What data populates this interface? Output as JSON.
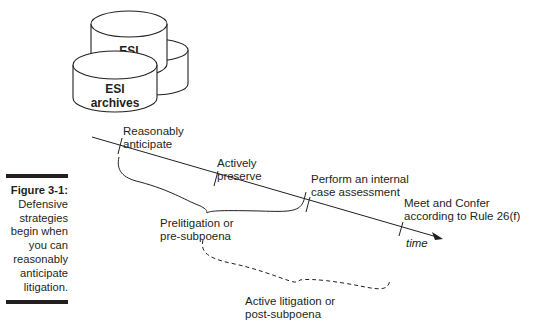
{
  "caption": {
    "figure_label": "Figure 3-1:",
    "lines": [
      "Defensive",
      "strategies",
      "begin when",
      "you can",
      "reasonably",
      "anticipate",
      "litigation."
    ]
  },
  "storage": {
    "back_cylinder_label": "ESI",
    "front_cylinder_label_line1": "ESI",
    "front_cylinder_label_line2": "archives"
  },
  "timeline": {
    "axis_label": "time",
    "milestones": [
      {
        "line1": "Reasonably",
        "line2": "anticipate"
      },
      {
        "line1": "Actively",
        "line2": "preserve"
      },
      {
        "line1": "Perform an internal",
        "line2": "case assessment"
      },
      {
        "line1": "Meet and Confer",
        "line2": "according to Rule 26(f)"
      }
    ],
    "phases": [
      {
        "line1": "Prelitigation or",
        "line2": "pre-subpoena",
        "style": "solid"
      },
      {
        "line1": "Active litigation or",
        "line2": "post-subpoena",
        "style": "dashed"
      }
    ]
  },
  "colors": {
    "ink": "#231f20",
    "background": "#ffffff"
  }
}
